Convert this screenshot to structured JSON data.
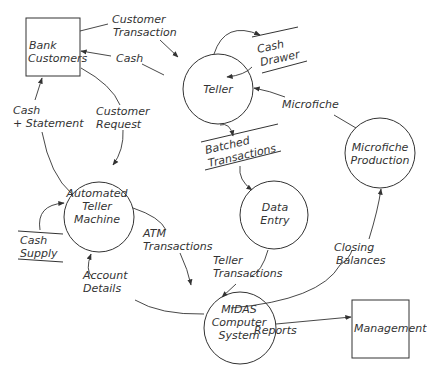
{
  "diagram": {
    "type": "data-flow-diagram",
    "entities": {
      "bank_customers": {
        "line1": "Bank",
        "line2": "Customers"
      },
      "management": {
        "label": "Management"
      }
    },
    "processes": {
      "teller": {
        "label": "Teller"
      },
      "atm": {
        "line1": "Automated",
        "line2": "Teller",
        "line3": "Machine"
      },
      "data_entry": {
        "line1": "Data",
        "line2": "Entry"
      },
      "microfiche_production": {
        "line1": "Microfiche",
        "line2": "Production"
      },
      "midas": {
        "line1": "MIDAS",
        "line2": "Computer",
        "line3": "System"
      }
    },
    "stores": {
      "cash_drawer": {
        "line1": "Cash",
        "line2": "Drawer"
      },
      "batched_transactions": {
        "line1": "Batched",
        "line2": "Transactions"
      },
      "cash_supply": {
        "line1": "Cash",
        "line2": "Supply"
      }
    },
    "flows": {
      "customer_transaction": {
        "line1": "Customer",
        "line2": "Transaction"
      },
      "cash": {
        "label": "Cash"
      },
      "cash_statement": {
        "line1": "Cash",
        "line2": "+ Statement"
      },
      "customer_request": {
        "line1": "Customer",
        "line2": "Request"
      },
      "microfiche": {
        "label": "Microfiche"
      },
      "atm_transactions": {
        "line1": "ATM",
        "line2": "Transactions"
      },
      "teller_transactions": {
        "line1": "Teller",
        "line2": "Transactions"
      },
      "account_details": {
        "line1": "Account",
        "line2": "Details"
      },
      "closing_balances": {
        "line1": "Closing",
        "line2": "Balances"
      },
      "reports": {
        "label": "Reports"
      }
    }
  }
}
